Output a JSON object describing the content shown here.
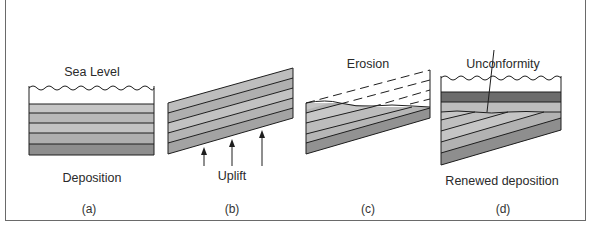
{
  "figure": {
    "panels": [
      {
        "id": "a",
        "caption": "(a)",
        "top_label": "Sea Level",
        "bottom_label": "Deposition"
      },
      {
        "id": "b",
        "caption": "(b)",
        "bottom_label": "Uplift"
      },
      {
        "id": "c",
        "caption": "(c)",
        "top_label": "Erosion"
      },
      {
        "id": "d",
        "caption": "(d)",
        "top_label": "Unconformity",
        "bottom_label": "Renewed deposition"
      }
    ]
  },
  "colors": {
    "layer_light": "#c4c4c4",
    "layer_mid": "#b2b2b2",
    "layer_dark": "#9a9a9a",
    "layer_darkest": "#6e6e6e",
    "line": "#1e1e1e"
  }
}
